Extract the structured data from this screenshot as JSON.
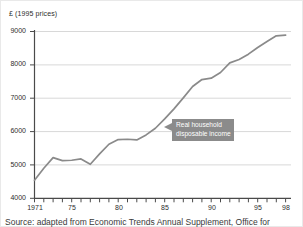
{
  "chart_data": {
    "type": "line",
    "title": "",
    "subtitle": "",
    "ylabel": "£ (1995 prices)",
    "xlabel": "",
    "ylim": [
      4000,
      9000
    ],
    "xlim": [
      1971,
      1998
    ],
    "grid": "horizontal",
    "legend_position": "none",
    "y_ticks": [
      "9000",
      "8000",
      "7000",
      "6000",
      "5000",
      "4000"
    ],
    "y_tick_values": [
      9000,
      8000,
      7000,
      6000,
      5000,
      4000
    ],
    "x_ticks": [
      "1971",
      "75",
      "80",
      "85",
      "90",
      "95",
      "98"
    ],
    "x_tick_values": [
      1971,
      1975,
      1980,
      1985,
      1990,
      1995,
      1998
    ],
    "series": [
      {
        "name": "Real household disposable income",
        "color": "#8a8a8a",
        "x": [
          1971,
          1972,
          1973,
          1974,
          1975,
          1976,
          1977,
          1978,
          1979,
          1980,
          1981,
          1982,
          1983,
          1984,
          1985,
          1986,
          1987,
          1988,
          1989,
          1990,
          1991,
          1992,
          1993,
          1994,
          1995,
          1996,
          1997,
          1998
        ],
        "values": [
          4540,
          4900,
          5220,
          5130,
          5140,
          5180,
          5020,
          5330,
          5620,
          5760,
          5770,
          5750,
          5900,
          6100,
          6380,
          6680,
          7010,
          7350,
          7560,
          7600,
          7770,
          8060,
          8160,
          8320,
          8520,
          8700,
          8870,
          8890
        ]
      }
    ],
    "annotations": [
      {
        "id": "series-callout",
        "lines": [
          "Real household",
          "disposable income"
        ],
        "background": "#8b8b8b",
        "text_color": "#ffffff",
        "points_to": {
          "x": 1985,
          "y": 6300
        }
      }
    ]
  },
  "source": {
    "note": "Source: adapted from Economic Trends Annual Supplement, Office for"
  },
  "colors": {
    "line": "#8a8a8a",
    "grid": "#d8d8d8",
    "axis": "#4a4a4a",
    "callout": "#8b8b8b",
    "background": "#ffffff"
  }
}
